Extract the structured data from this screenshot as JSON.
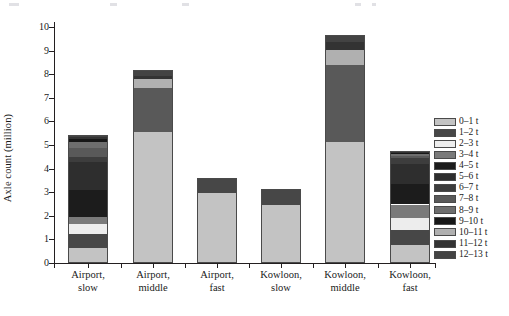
{
  "chart_data": {
    "type": "bar",
    "subtype": "stacked-vertical",
    "title": "",
    "xlabel": "",
    "ylabel": "Axle count (million)",
    "ylim": [
      0,
      10
    ],
    "yticks": [
      0,
      1,
      2,
      3,
      4,
      5,
      6,
      7,
      8,
      9,
      10
    ],
    "ytick_labels": [
      "0",
      "1",
      "2",
      "3",
      "4",
      "5",
      "6",
      "7",
      "8",
      "9",
      "10"
    ],
    "grid": false,
    "legend_position": "right",
    "categories": [
      "Airport,\nslow",
      "Airport,\nmiddle",
      "Airport,\nfast",
      "Kowloon,\nslow",
      "Kowloon,\nmiddle",
      "Kowloon,\nfast"
    ],
    "category_lines": [
      [
        "Airport,",
        "slow"
      ],
      [
        "Airport,",
        "middle"
      ],
      [
        "Airport,",
        "fast"
      ],
      [
        "Kowloon,",
        "slow"
      ],
      [
        "Kowloon,",
        "middle"
      ],
      [
        "Kowloon,",
        "fast"
      ]
    ],
    "series": [
      {
        "name": "0–1 t",
        "color": "#c3c3c3",
        "values": [
          0.62,
          5.55,
          2.98,
          2.47,
          5.12,
          0.76
        ]
      },
      {
        "name": "1–2 t",
        "color": "#474747",
        "values": [
          0.63,
          0.0,
          0.62,
          0.66,
          0.0,
          0.64
        ]
      },
      {
        "name": "2–3 t",
        "color": "#ededed",
        "values": [
          0.42,
          0.0,
          0.0,
          0.0,
          0.0,
          0.51
        ]
      },
      {
        "name": "3–4 t",
        "color": "#7a7a7a",
        "values": [
          0.28,
          0.0,
          0.0,
          0.0,
          0.0,
          0.57
        ]
      },
      {
        "name": "4–5 t",
        "color": "#1c1c1c",
        "values": [
          1.13,
          0.0,
          0.0,
          0.0,
          0.0,
          0.88
        ]
      },
      {
        "name": "5–6 t",
        "color": "#2e2e2e",
        "values": [
          1.18,
          0.0,
          0.0,
          0.0,
          0.0,
          0.82
        ]
      },
      {
        "name": "6–7 t",
        "color": "#3d3d3d",
        "values": [
          0.25,
          0.0,
          0.0,
          0.0,
          0.0,
          0.25
        ]
      },
      {
        "name": "7–8 t",
        "color": "#595959",
        "values": [
          0.38,
          1.85,
          0.0,
          0.0,
          3.28,
          0.1
        ]
      },
      {
        "name": "8–9 t",
        "color": "#6e6e6e",
        "values": [
          0.23,
          0.0,
          0.0,
          0.0,
          0.0,
          0.08
        ]
      },
      {
        "name": "9–10 t",
        "color": "#171717",
        "values": [
          0.15,
          0.0,
          0.0,
          0.0,
          0.0,
          0.06
        ]
      },
      {
        "name": "10–11 t",
        "color": "#b0b0b0",
        "values": [
          0.0,
          0.4,
          0.0,
          0.0,
          0.62,
          0.0
        ]
      },
      {
        "name": "11–12 t",
        "color": "#333333",
        "values": [
          0.08,
          0.13,
          0.0,
          0.0,
          0.33,
          0.04
        ]
      },
      {
        "name": "12–13 t",
        "color": "#434343",
        "values": [
          0.07,
          0.23,
          0.0,
          0.0,
          0.33,
          0.04
        ]
      }
    ],
    "bar_totals": [
      5.42,
      8.16,
      3.6,
      3.13,
      9.68,
      4.75
    ]
  },
  "legend": {
    "entries": [
      {
        "label": "0–1 t",
        "color": "#c3c3c3"
      },
      {
        "label": "1–2 t",
        "color": "#474747"
      },
      {
        "label": "2–3 t",
        "color": "#ededed"
      },
      {
        "label": "3–4 t",
        "color": "#7a7a7a"
      },
      {
        "label": "4–5 t",
        "color": "#1c1c1c"
      },
      {
        "label": "5–6 t",
        "color": "#2e2e2e"
      },
      {
        "label": "6–7 t",
        "color": "#3d3d3d"
      },
      {
        "label": "7–8 t",
        "color": "#595959"
      },
      {
        "label": "8–9 t",
        "color": "#6e6e6e"
      },
      {
        "label": "9–10 t",
        "color": "#171717"
      },
      {
        "label": "10–11 t",
        "color": "#b0b0b0"
      },
      {
        "label": "11–12 t",
        "color": "#333333"
      },
      {
        "label": "12–13 t",
        "color": "#434343"
      }
    ]
  },
  "axis": {
    "y_title": "Axle count (million)"
  }
}
